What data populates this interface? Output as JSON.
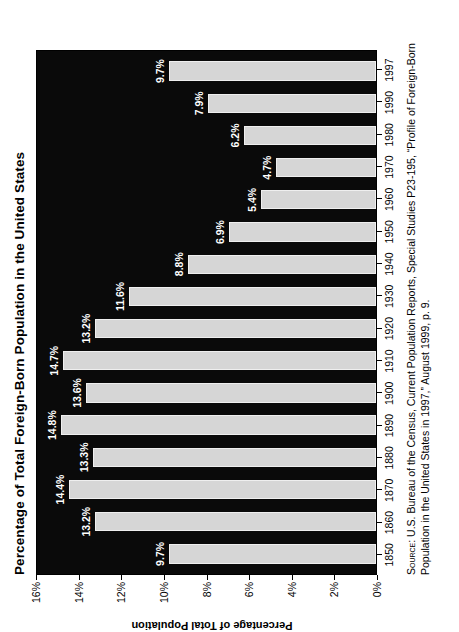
{
  "chart_data": {
    "type": "bar",
    "orientation": "vertical",
    "title": "Percentage of Total Foreign-Born Population in the United States",
    "xlabel": "",
    "ylabel": "Percentage of Total Population",
    "categories": [
      "1850",
      "1860",
      "1870",
      "1880",
      "1890",
      "1900",
      "1910",
      "1920",
      "1930",
      "1940",
      "1950",
      "1960",
      "1970",
      "1980",
      "1990",
      "1997"
    ],
    "values": [
      9.7,
      13.2,
      14.4,
      13.3,
      14.8,
      13.6,
      14.7,
      13.2,
      11.6,
      8.8,
      6.9,
      5.4,
      4.7,
      6.2,
      7.9,
      9.7
    ],
    "value_labels": [
      "9.7%",
      "13.2%",
      "14.4%",
      "13.3%",
      "14.8%",
      "13.6%",
      "14.7%",
      "13.2%",
      "11.6%",
      "8.8%",
      "6.9%",
      "5.4%",
      "4.7%",
      "6.2%",
      "7.9%",
      "9.7%"
    ],
    "ylim": [
      0,
      16
    ],
    "ytick_values": [
      0,
      2,
      4,
      6,
      8,
      10,
      12,
      14,
      16
    ],
    "ytick_labels": [
      "0%",
      "2%",
      "4%",
      "6%",
      "8%",
      "10%",
      "12%",
      "14%",
      "16%"
    ],
    "grid": false,
    "legend": false,
    "bar_color": "#d6d6d6",
    "plot_background": "#0a0a0a",
    "label_color": "#ffffff",
    "page_background": "#ffffff"
  },
  "source": {
    "keyword": "Source:",
    "text": " U.S. Bureau of the Census, Current Population Reports, Special Studies P23-195, “Profile of Foreign-Born Population in the United States in 1997,” August 1999, p. 9."
  }
}
